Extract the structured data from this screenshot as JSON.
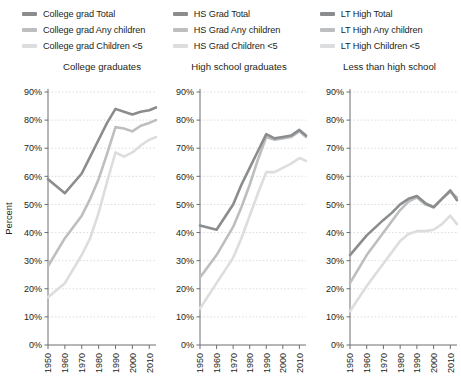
{
  "legend": {
    "columns": [
      {
        "name": "college-grad",
        "items": [
          {
            "label": "College grad Total",
            "color": "#8a8c8e",
            "swatch": "line-swatch"
          },
          {
            "label": "College grad Any children",
            "color": "#bcbec0",
            "swatch": "line-swatch"
          },
          {
            "label": "College grad Children <5",
            "color": "#dcdddf",
            "swatch": "line-swatch"
          }
        ]
      },
      {
        "name": "hs-grad",
        "items": [
          {
            "label": "HS Grad Total",
            "color": "#8a8c8e",
            "swatch": "line-swatch"
          },
          {
            "label": "HS Grad Any children",
            "color": "#bcbec0",
            "swatch": "line-swatch"
          },
          {
            "label": "HS Grad Children <5",
            "color": "#dcdddf",
            "swatch": "line-swatch"
          }
        ]
      },
      {
        "name": "lt-high",
        "items": [
          {
            "label": "LT High Total",
            "color": "#8a8c8e",
            "swatch": "line-swatch"
          },
          {
            "label": "LT High Any children",
            "color": "#bcbec0",
            "swatch": "line-swatch"
          },
          {
            "label": "LT High Children <5",
            "color": "#dcdddf",
            "swatch": "line-swatch"
          }
        ]
      }
    ]
  },
  "chart_data": [
    {
      "type": "line",
      "title": "College graduates",
      "xlabel": "",
      "ylabel": "Percent",
      "ylim": [
        0,
        90
      ],
      "yticks": [
        0,
        10,
        20,
        30,
        40,
        50,
        60,
        70,
        80,
        90
      ],
      "ytick_labels": [
        "0%",
        "10%",
        "20%",
        "30%",
        "40%",
        "50%",
        "60%",
        "70%",
        "80%",
        "90%"
      ],
      "xlim": [
        1950,
        2014
      ],
      "xticks": [
        1950,
        1960,
        1970,
        1980,
        1990,
        2000,
        2010
      ],
      "xtick_labels": [
        "1950",
        "1960",
        "1970",
        "1980",
        "1990",
        "2000",
        "2010"
      ],
      "grid": true,
      "legend_position": "top",
      "x": [
        1950,
        1960,
        1970,
        1975,
        1980,
        1985,
        1990,
        1995,
        2000,
        2005,
        2010,
        2014
      ],
      "series": [
        {
          "name": "College grad Total",
          "color": "#8a8c8e",
          "values": [
            59,
            54,
            61,
            67,
            73,
            79,
            84,
            83,
            82,
            83,
            83.5,
            84.5
          ]
        },
        {
          "name": "College grad Any children",
          "color": "#bcbec0",
          "values": [
            28,
            38,
            46,
            52,
            59,
            68,
            77.5,
            77,
            76,
            78,
            79,
            80
          ]
        },
        {
          "name": "College grad Children <5",
          "color": "#dcdddf",
          "values": [
            17,
            22,
            32,
            38,
            47,
            58,
            68.5,
            67,
            68.5,
            71,
            73,
            74
          ]
        }
      ]
    },
    {
      "type": "line",
      "title": "High school graduates",
      "xlabel": "",
      "ylabel": "",
      "ylim": [
        0,
        90
      ],
      "yticks": [
        0,
        10,
        20,
        30,
        40,
        50,
        60,
        70,
        80,
        90
      ],
      "ytick_labels": [
        "0%",
        "10%",
        "20%",
        "30%",
        "40%",
        "50%",
        "60%",
        "70%",
        "80%",
        "90%"
      ],
      "xlim": [
        1950,
        2014
      ],
      "xticks": [
        1950,
        1960,
        1970,
        1980,
        1990,
        2000,
        2010
      ],
      "xtick_labels": [
        "1950",
        "1960",
        "1970",
        "1980",
        "1990",
        "2000",
        "2010"
      ],
      "grid": true,
      "legend_position": "top",
      "x": [
        1950,
        1960,
        1970,
        1975,
        1980,
        1985,
        1990,
        1995,
        2000,
        2005,
        2010,
        2014
      ],
      "series": [
        {
          "name": "HS Grad Total",
          "color": "#8a8c8e",
          "values": [
            42.5,
            41,
            50,
            57,
            63,
            69,
            75,
            73.5,
            74,
            74.5,
            76.5,
            74.5
          ]
        },
        {
          "name": "HS Grad Any children",
          "color": "#bcbec0",
          "values": [
            24,
            32,
            42,
            49,
            57,
            66,
            74,
            73,
            73.5,
            74,
            76,
            74
          ]
        },
        {
          "name": "HS Grad Children <5",
          "color": "#dcdddf",
          "values": [
            13,
            22,
            31,
            38,
            46,
            54,
            61.5,
            61.5,
            63,
            64.5,
            66.5,
            65.5
          ]
        }
      ]
    },
    {
      "type": "line",
      "title": "Less than high school",
      "xlabel": "",
      "ylabel": "",
      "ylim": [
        0,
        90
      ],
      "yticks": [
        0,
        10,
        20,
        30,
        40,
        50,
        60,
        70,
        80,
        90
      ],
      "ytick_labels": [
        "0%",
        "10%",
        "20%",
        "30%",
        "40%",
        "50%",
        "60%",
        "70%",
        "80%",
        "90%"
      ],
      "xlim": [
        1950,
        2014
      ],
      "xticks": [
        1950,
        1960,
        1970,
        1980,
        1990,
        2000,
        2010
      ],
      "xtick_labels": [
        "1950",
        "1960",
        "1970",
        "1980",
        "1990",
        "2000",
        "2010"
      ],
      "grid": true,
      "legend_position": "top",
      "x": [
        1950,
        1960,
        1970,
        1975,
        1980,
        1985,
        1990,
        1995,
        2000,
        2005,
        2010,
        2014
      ],
      "series": [
        {
          "name": "LT High Total",
          "color": "#8a8c8e",
          "values": [
            32,
            39,
            44.5,
            47,
            50,
            52,
            53,
            50.5,
            49,
            52,
            55,
            51.5
          ]
        },
        {
          "name": "LT High Any children",
          "color": "#bcbec0",
          "values": [
            22,
            32,
            40,
            44,
            48,
            51,
            52.5,
            50,
            49,
            52,
            54.5,
            52.5
          ]
        },
        {
          "name": "LT High Children <5",
          "color": "#dcdddf",
          "values": [
            12,
            21,
            29,
            33,
            37,
            39.5,
            40.5,
            40.5,
            41,
            43,
            46,
            43
          ]
        }
      ]
    }
  ]
}
